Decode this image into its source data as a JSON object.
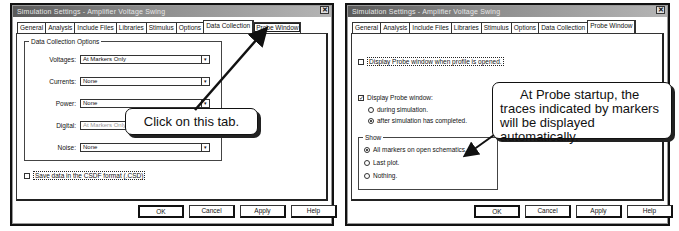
{
  "left_dialog": {
    "title": "Simulation Settings - Amplifier Voltage Swing",
    "close_label": "x",
    "tabs": [
      "General",
      "Analysis",
      "Include Files",
      "Libraries",
      "Stimulus",
      "Options",
      "Data Collection",
      "Probe Window"
    ],
    "active_tab": "Data Collection",
    "group_label": "Data Collection Options",
    "fields": [
      {
        "label": "Voltages:",
        "value": "At Markers Only"
      },
      {
        "label": "Currents:",
        "value": "None"
      },
      {
        "label": "Power:",
        "value": "None"
      },
      {
        "label": "Digital:",
        "value": "At Markers Only"
      },
      {
        "label": "Noise:",
        "value": "None"
      }
    ],
    "save_checkbox": {
      "label": "Save data in the CSDF format (.CSD)",
      "checked": false
    },
    "buttons": {
      "ok": "OK",
      "cancel": "Cancel",
      "apply": "Apply",
      "help": "Help"
    },
    "callout": "Click on this tab."
  },
  "right_dialog": {
    "title": "Simulation Settings - Amplifier Voltage Swing",
    "close_label": "x",
    "tabs": [
      "General",
      "Analysis",
      "Include Files",
      "Libraries",
      "Stimulus",
      "Options",
      "Data Collection",
      "Probe Window"
    ],
    "active_tab": "Probe Window",
    "display_on_open": {
      "label": "Display Probe window when profile is opened.",
      "checked": false
    },
    "display_probe": {
      "label": "Display Probe window:",
      "checked": true
    },
    "display_options": [
      {
        "label": "during simulation.",
        "selected": false
      },
      {
        "label": "after simulation has completed.",
        "selected": true
      }
    ],
    "show_group": {
      "label": "Show",
      "options": [
        {
          "label": "All markers on open schematics.",
          "selected": true
        },
        {
          "label": "Last plot.",
          "selected": false
        },
        {
          "label": "Nothing.",
          "selected": false
        }
      ]
    },
    "buttons": {
      "ok": "OK",
      "cancel": "Cancel",
      "apply": "Apply",
      "help": "Help"
    },
    "callout": "At Probe startup, the traces indicated by markers will be displayed automatically."
  },
  "icons": {
    "dropdown": "▾",
    "check": "✓",
    "close": "✕"
  }
}
